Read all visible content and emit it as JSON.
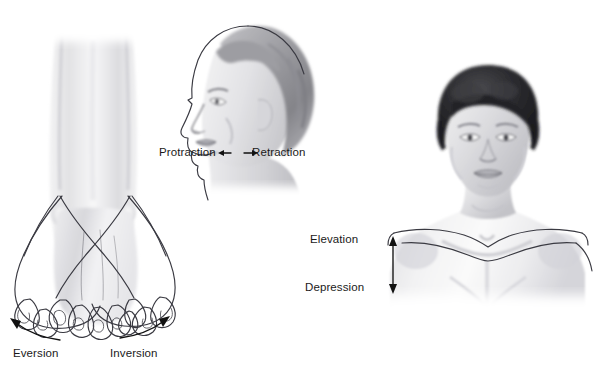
{
  "figure": {
    "background_color": "#ffffff",
    "label_color": "#1a1a1a",
    "ink_color": "#3a3a42"
  },
  "panels": [
    {
      "id": "foot",
      "name": "foot-eversion-inversion",
      "description": "Anterior view of lower leg and foot with two overlapping tilted foot outlines",
      "labels": [
        {
          "text": "Eversion",
          "x": 13,
          "y": 348
        },
        {
          "text": "Inversion",
          "x": 110,
          "y": 348
        }
      ],
      "arrows": [
        {
          "name": "eversion-curved-arrow",
          "direction": "up-left"
        },
        {
          "name": "inversion-curved-arrow",
          "direction": "up-right"
        }
      ]
    },
    {
      "id": "head-profile",
      "name": "head-protraction-retraction",
      "description": "Lateral profile of a head with offset outline showing protracted position",
      "labels": [
        {
          "text": "Protraction",
          "x": 159,
          "y": 147
        },
        {
          "text": "Retraction",
          "x": 252,
          "y": 147
        }
      ],
      "arrows": [
        {
          "name": "protraction-arrow",
          "direction": "left"
        },
        {
          "name": "retraction-arrow",
          "direction": "right"
        }
      ]
    },
    {
      "id": "shoulders",
      "name": "shoulder-elevation-depression",
      "description": "Anterior view of head and shoulders with elevated and depressed shoulder outlines",
      "labels": [
        {
          "text": "Elevation",
          "x": 310,
          "y": 234
        },
        {
          "text": "Depression",
          "x": 305,
          "y": 282
        }
      ],
      "arrows": [
        {
          "name": "elevation-depression-double-arrow",
          "direction": "vertical-both"
        }
      ]
    }
  ]
}
